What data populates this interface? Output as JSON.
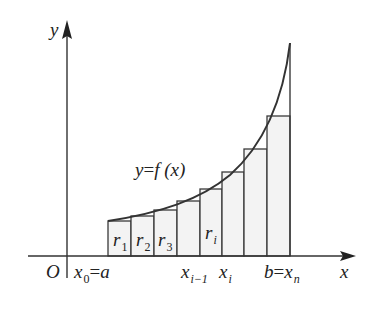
{
  "diagram": {
    "type": "riemann-sum-left-endpoint",
    "colors": {
      "line": "#3a3a3a",
      "bar_fill": "#f2f2f2",
      "text": "#222222",
      "background": "#ffffff"
    },
    "axes": {
      "x_label": "x",
      "y_label": "y",
      "origin_label": "O"
    },
    "curve_label": {
      "lhs": "y",
      "eq": "=",
      "rhs": "f (x)"
    },
    "bars": [
      {
        "label": "r",
        "sub": "1"
      },
      {
        "label": "r",
        "sub": "2"
      },
      {
        "label": "r",
        "sub": "3"
      },
      {
        "label": "",
        "sub": ""
      },
      {
        "label": "r",
        "sub": "i"
      },
      {
        "label": "",
        "sub": ""
      },
      {
        "label": "",
        "sub": ""
      },
      {
        "label": "",
        "sub": ""
      }
    ],
    "ticks": {
      "x0": {
        "var": "x",
        "sub": "0",
        "eq": "=",
        "val": "a"
      },
      "xi_minus_1": {
        "var": "x",
        "sub": "i−1"
      },
      "xi": {
        "var": "x",
        "sub": "i"
      },
      "xn": {
        "lhs": "b",
        "eq": "=",
        "var": "x",
        "sub": "n"
      }
    }
  }
}
